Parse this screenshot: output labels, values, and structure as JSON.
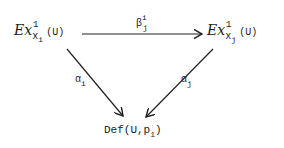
{
  "nodes": {
    "source": {
      "script": "Ex",
      "sup": "1",
      "sub_x": "x",
      "sub_idx": "i",
      "arg": "(U)"
    },
    "target": {
      "script": "Ex",
      "sup": "1",
      "sub_x": "x",
      "sub_idx": "j",
      "arg": "(U)"
    },
    "bottom": {
      "text": "Def(U,p",
      "sub": "1",
      "close": ")"
    }
  },
  "arrows": {
    "top": {
      "label": "β",
      "sup": "i",
      "sub": "j"
    },
    "left": {
      "label": "α",
      "sub": "i"
    },
    "right": {
      "label": "α",
      "sub": "j"
    }
  },
  "colors": {
    "ink": "#222222",
    "background": "#ffffff"
  }
}
